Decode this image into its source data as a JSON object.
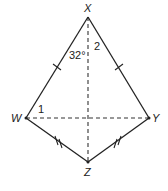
{
  "diagram": {
    "type": "kite",
    "vertices": {
      "X": {
        "label": "X",
        "x": 88,
        "y": 17
      },
      "W": {
        "label": "W",
        "x": 26,
        "y": 118
      },
      "Y": {
        "label": "Y",
        "x": 149,
        "y": 118
      },
      "Z": {
        "label": "Z",
        "x": 88,
        "y": 162
      }
    },
    "sides": [
      {
        "from": "X",
        "to": "W",
        "tick_marks": 1
      },
      {
        "from": "X",
        "to": "Y",
        "tick_marks": 1
      },
      {
        "from": "W",
        "to": "Z",
        "tick_marks": 2
      },
      {
        "from": "Y",
        "to": "Z",
        "tick_marks": 2
      }
    ],
    "diagonals": [
      {
        "from": "X",
        "to": "Z",
        "style": "dashed"
      },
      {
        "from": "W",
        "to": "Y",
        "style": "dashed"
      }
    ],
    "angle_labels": {
      "angle_wxz": "32°",
      "angle_2": "2",
      "angle_1": "1"
    }
  }
}
